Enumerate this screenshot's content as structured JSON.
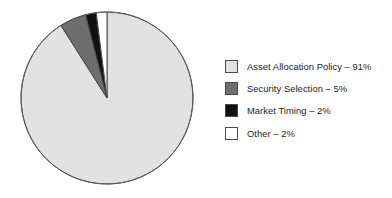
{
  "figure": {
    "background_color": "#ffffff",
    "width": 392,
    "height": 198
  },
  "chart_data": {
    "type": "pie",
    "title": "",
    "subtitle": "",
    "xlabel": "",
    "ylabel": "",
    "grid": false,
    "legend_position": "right",
    "units": "percent",
    "start_angle_deg": 0,
    "direction": "counterclockwise",
    "categories": [
      "Asset Allocation Policy",
      "Security Selection",
      "Market Timing",
      "Other"
    ],
    "values": [
      91,
      5,
      2,
      2
    ],
    "value_labels": [
      "91%",
      "5%",
      "2%",
      "2%"
    ],
    "colors": [
      "#e2e2e2",
      "#6e6e6e",
      "#111111",
      "#ffffff"
    ],
    "slice_edge_color": "#4a4a4a",
    "slices": [
      {
        "name": "Asset Allocation Policy",
        "value": 91,
        "value_label": "91%",
        "color": "#e2e2e2",
        "start_angle_deg": 32.4,
        "end_angle_deg": 360.0
      },
      {
        "name": "Security Selection",
        "value": 5,
        "value_label": "5%",
        "color": "#6e6e6e",
        "start_angle_deg": 14.4,
        "end_angle_deg": 32.4
      },
      {
        "name": "Market Timing",
        "value": 2,
        "value_label": "2%",
        "color": "#111111",
        "start_angle_deg": 7.2,
        "end_angle_deg": 14.4
      },
      {
        "name": "Other",
        "value": 2,
        "value_label": "2%",
        "color": "#ffffff",
        "start_angle_deg": 0.0,
        "end_angle_deg": 7.2
      }
    ],
    "legend": [
      {
        "label": "Asset Allocation Policy – 91%",
        "color": "#e2e2e2"
      },
      {
        "label": "Security Selection – 5%",
        "color": "#6e6e6e"
      },
      {
        "label": "Market Timing – 2%",
        "color": "#111111"
      },
      {
        "label": "Other – 2%",
        "color": "#ffffff"
      }
    ]
  }
}
